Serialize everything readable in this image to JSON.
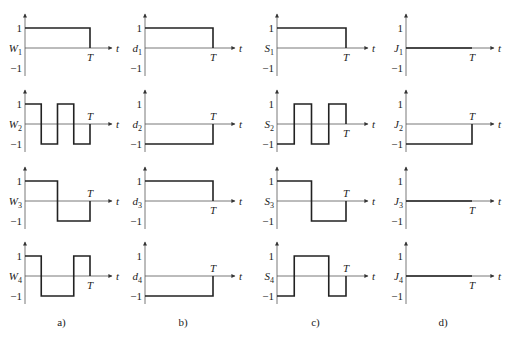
{
  "figure": {
    "columns": [
      {
        "caption": "a)",
        "symbol": "W",
        "rows": [
          {
            "label": "W",
            "sub": "1",
            "t_label": "T",
            "t_axis": "t",
            "levels": [
              [
                0,
                1,
                1
              ]
            ],
            "end_drop": true
          },
          {
            "label": "W",
            "sub": "2",
            "t_label": "T",
            "t_axis": "t",
            "levels": [
              [
                0,
                0.25,
                1
              ],
              [
                0.25,
                0.5,
                -1
              ],
              [
                0.5,
                0.75,
                1
              ],
              [
                0.75,
                1,
                -1
              ]
            ],
            "end_drop": true
          },
          {
            "label": "W",
            "sub": "3",
            "t_label": "T",
            "t_axis": "t",
            "levels": [
              [
                0,
                0.5,
                1
              ],
              [
                0.5,
                1,
                -1
              ]
            ],
            "end_drop": true
          },
          {
            "label": "W",
            "sub": "4",
            "t_label": "T",
            "t_axis": "t",
            "levels": [
              [
                0,
                0.25,
                1
              ],
              [
                0.25,
                0.75,
                -1
              ],
              [
                0.75,
                1,
                1
              ]
            ],
            "end_drop": true
          }
        ]
      },
      {
        "caption": "b)",
        "symbol": "d",
        "rows": [
          {
            "label": "d",
            "sub": "1",
            "t_label": "T",
            "t_axis": "t",
            "levels": [
              [
                0,
                1,
                1
              ]
            ],
            "end_drop": true
          },
          {
            "label": "d",
            "sub": "2",
            "t_label": "T",
            "t_axis": "t",
            "levels": [
              [
                0,
                1,
                -1
              ]
            ],
            "end_drop": true
          },
          {
            "label": "d",
            "sub": "3",
            "t_label": "T",
            "t_axis": "t",
            "levels": [
              [
                0,
                1,
                1
              ]
            ],
            "end_drop": true
          },
          {
            "label": "d",
            "sub": "4",
            "t_label": "T",
            "t_axis": "t",
            "levels": [
              [
                0,
                1,
                -1
              ]
            ],
            "end_drop": true
          }
        ]
      },
      {
        "caption": "c)",
        "symbol": "S",
        "rows": [
          {
            "label": "S",
            "sub": "1",
            "t_label": "T",
            "t_axis": "t",
            "levels": [
              [
                0,
                1,
                1
              ]
            ],
            "end_drop": true
          },
          {
            "label": "S",
            "sub": "2",
            "t_label": "T",
            "t_axis": "t",
            "levels": [
              [
                0,
                0.25,
                -1
              ],
              [
                0.25,
                0.5,
                1
              ],
              [
                0.5,
                0.75,
                -1
              ],
              [
                0.75,
                1,
                1
              ]
            ],
            "end_drop": true
          },
          {
            "label": "S",
            "sub": "3",
            "t_label": "T",
            "t_axis": "t",
            "levels": [
              [
                0,
                0.5,
                1
              ],
              [
                0.5,
                1,
                -1
              ]
            ],
            "end_drop": true
          },
          {
            "label": "S",
            "sub": "4",
            "t_label": "T",
            "t_axis": "t",
            "levels": [
              [
                0,
                0.25,
                -1
              ],
              [
                0.25,
                0.75,
                1
              ],
              [
                0.75,
                1,
                -1
              ]
            ],
            "end_drop": true
          }
        ]
      },
      {
        "caption": "d)",
        "symbol": "J",
        "rows": [
          {
            "label": "J",
            "sub": "1",
            "t_label": "T",
            "t_axis": "t",
            "levels": [
              [
                0,
                1,
                0
              ]
            ],
            "end_drop": false
          },
          {
            "label": "J",
            "sub": "2",
            "t_label": "T",
            "t_axis": "t",
            "levels": [
              [
                0,
                1,
                -1
              ]
            ],
            "end_drop": true
          },
          {
            "label": "J",
            "sub": "3",
            "t_label": "T",
            "t_axis": "t",
            "levels": [
              [
                0,
                1,
                0
              ]
            ],
            "end_drop": false
          },
          {
            "label": "J",
            "sub": "4",
            "t_label": "T",
            "t_axis": "t",
            "levels": [
              [
                0,
                1,
                0
              ]
            ],
            "end_drop": false
          }
        ]
      }
    ],
    "tick_labels": {
      "pos": "1",
      "neg": "−1"
    },
    "colors": {
      "wave": "#222222",
      "axis": "#555555",
      "text": "#222222",
      "background": "#ffffff"
    }
  }
}
